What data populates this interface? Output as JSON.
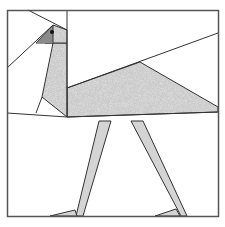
{
  "figure": {
    "colors": {
      "background": "#ffffff",
      "outline": "#333333",
      "frame": "#555555",
      "stipple_fill": "#c4c4c4",
      "stipple_dark": "#9a9a9a",
      "beak": "#8a8a8a",
      "leg": "#d4d4d4",
      "eye": "#111111"
    },
    "pieces": [
      {
        "name": "head",
        "fill": "stipple"
      },
      {
        "name": "beak",
        "fill": "dark-gray"
      },
      {
        "name": "eye",
        "fill": "black"
      },
      {
        "name": "neck",
        "fill": "stipple"
      },
      {
        "name": "body",
        "fill": "stipple"
      },
      {
        "name": "leg-left",
        "fill": "light-gray"
      },
      {
        "name": "leg-right",
        "fill": "light-gray"
      },
      {
        "name": "foot-left",
        "fill": "light-gray"
      },
      {
        "name": "foot-right",
        "fill": "light-gray"
      }
    ]
  }
}
